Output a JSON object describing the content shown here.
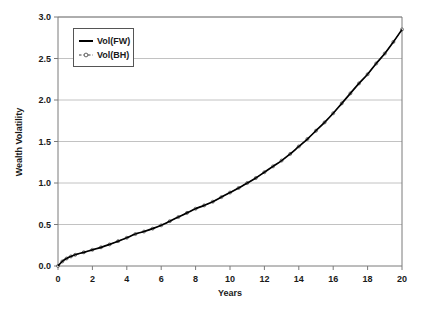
{
  "chart_data": {
    "type": "line",
    "title": "",
    "xlabel": "Years",
    "ylabel": "Wealth Volatility",
    "xlim": [
      0,
      20
    ],
    "ylim": [
      0,
      3.0
    ],
    "xticks": [
      "0",
      "2",
      "4",
      "6",
      "8",
      "10",
      "12",
      "14",
      "16",
      "18",
      "20"
    ],
    "xtick_values": [
      0,
      2,
      4,
      6,
      8,
      10,
      12,
      14,
      16,
      18,
      20
    ],
    "yticks": [
      "0.0",
      "0.5",
      "1.0",
      "1.5",
      "2.0",
      "2.5",
      "3.0"
    ],
    "ytick_values": [
      0,
      0.5,
      1.0,
      1.5,
      2.0,
      2.5,
      3.0
    ],
    "grid": "horizontal",
    "legend_position": "top-left",
    "x": [
      0,
      0.25,
      0.5,
      0.75,
      1,
      1.5,
      2,
      2.5,
      3,
      3.5,
      4,
      4.5,
      5,
      5.5,
      6,
      6.5,
      7,
      7.5,
      8,
      8.5,
      9,
      9.5,
      10,
      10.5,
      11,
      11.5,
      12,
      12.5,
      13,
      13.5,
      14,
      14.5,
      15,
      15.5,
      16,
      16.5,
      17,
      17.5,
      18,
      18.5,
      19,
      19.5,
      20
    ],
    "series": [
      {
        "name": "Vol(FW)",
        "style": "solid",
        "color": "#000000",
        "values": [
          0.0,
          0.055,
          0.09,
          0.115,
          0.135,
          0.165,
          0.195,
          0.225,
          0.26,
          0.3,
          0.34,
          0.385,
          0.415,
          0.45,
          0.49,
          0.54,
          0.59,
          0.64,
          0.69,
          0.73,
          0.775,
          0.83,
          0.885,
          0.94,
          1.0,
          1.06,
          1.13,
          1.2,
          1.27,
          1.35,
          1.44,
          1.53,
          1.63,
          1.73,
          1.84,
          1.96,
          2.08,
          2.2,
          2.31,
          2.44,
          2.56,
          2.7,
          2.85
        ]
      },
      {
        "name": "Vol(BH)",
        "style": "dashed-marker",
        "color": "#3c3c3c",
        "values": [
          0.0,
          0.055,
          0.09,
          0.115,
          0.135,
          0.165,
          0.195,
          0.225,
          0.26,
          0.3,
          0.34,
          0.385,
          0.415,
          0.45,
          0.49,
          0.54,
          0.59,
          0.64,
          0.69,
          0.73,
          0.775,
          0.83,
          0.885,
          0.94,
          1.0,
          1.06,
          1.13,
          1.2,
          1.27,
          1.35,
          1.44,
          1.53,
          1.63,
          1.73,
          1.84,
          1.96,
          2.08,
          2.2,
          2.31,
          2.44,
          2.56,
          2.7,
          2.85
        ]
      }
    ],
    "legend": [
      {
        "label": "Vol(FW)",
        "style": "solid"
      },
      {
        "label": "Vol(BH)",
        "style": "dashed-marker"
      }
    ],
    "colors": {
      "series_fw": "#000000",
      "series_bh": "#3c3c3c",
      "gridline": "#b3b3b3",
      "axis": "#7a7a7a",
      "text": "#1a1a1a",
      "background": "#ffffff"
    }
  }
}
